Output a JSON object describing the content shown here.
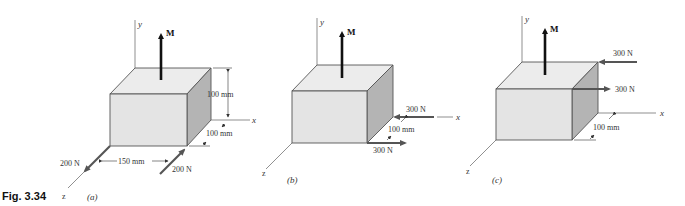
{
  "figure": {
    "label": "Fig. 3.34",
    "colors": {
      "top_face": "#ececec",
      "front_face": "#e4e4e4",
      "side_face": "#b4b4b4",
      "moment_arrow": "#111111",
      "force_arrow": "#555555"
    }
  },
  "panels": [
    {
      "id": "a",
      "caption": "(a)",
      "moment_label": "M",
      "axes": {
        "x": "x",
        "y": "y",
        "z": "z"
      },
      "dimensions": [
        "100 mm",
        "100 mm",
        "150 mm"
      ],
      "forces": [
        "200 N",
        "200 N"
      ]
    },
    {
      "id": "b",
      "caption": "(b)",
      "moment_label": "M",
      "axes": {
        "x": "x",
        "y": "y",
        "z": "z"
      },
      "dimensions": [
        "100 mm"
      ],
      "forces": [
        "300 N",
        "300 N"
      ]
    },
    {
      "id": "c",
      "caption": "(c)",
      "moment_label": "M",
      "axes": {
        "x": "x",
        "y": "y",
        "z": "z"
      },
      "dimensions": [
        "100 mm"
      ],
      "forces": [
        "300 N",
        "300 N"
      ]
    }
  ]
}
